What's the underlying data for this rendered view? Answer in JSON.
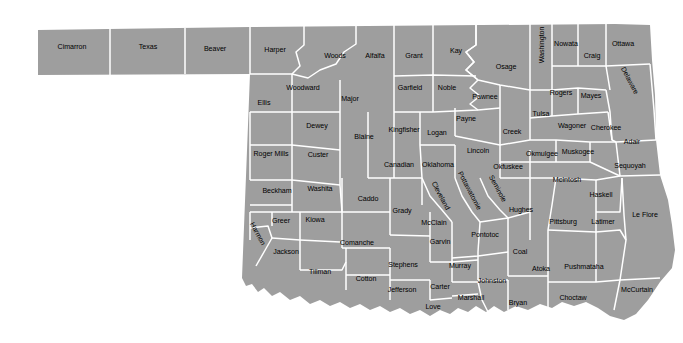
{
  "map": {
    "title": "Oklahoma County Map",
    "state": "Oklahoma",
    "colors": {
      "land_fill": "#9e9e9e",
      "border": "#ffffff",
      "background": "#ffffff",
      "label_text": "#000000"
    },
    "county_count": 77,
    "counties": [
      {
        "name": "Cimarron",
        "x": 72,
        "y": 48,
        "rot": 0
      },
      {
        "name": "Texas",
        "x": 148,
        "y": 48,
        "rot": 0
      },
      {
        "name": "Beaver",
        "x": 215,
        "y": 50,
        "rot": 0
      },
      {
        "name": "Harper",
        "x": 275,
        "y": 51,
        "rot": 0
      },
      {
        "name": "Woods",
        "x": 335,
        "y": 57,
        "rot": 0
      },
      {
        "name": "Alfalfa",
        "x": 375,
        "y": 57,
        "rot": 0
      },
      {
        "name": "Grant",
        "x": 414,
        "y": 57,
        "rot": 0
      },
      {
        "name": "Kay",
        "x": 456,
        "y": 52,
        "rot": 0
      },
      {
        "name": "Osage",
        "x": 506,
        "y": 68,
        "rot": 0
      },
      {
        "name": "Washington",
        "x": 543,
        "y": 45,
        "rot": -90
      },
      {
        "name": "Nowata",
        "x": 566,
        "y": 45,
        "rot": 0
      },
      {
        "name": "Craig",
        "x": 592,
        "y": 57,
        "rot": 0
      },
      {
        "name": "Ottawa",
        "x": 623,
        "y": 45,
        "rot": 0
      },
      {
        "name": "Woodward",
        "x": 303,
        "y": 89,
        "rot": 0
      },
      {
        "name": "Ellis",
        "x": 264,
        "y": 104,
        "rot": 0
      },
      {
        "name": "Major",
        "x": 350,
        "y": 100,
        "rot": 0
      },
      {
        "name": "Garfield",
        "x": 410,
        "y": 89,
        "rot": 0
      },
      {
        "name": "Noble",
        "x": 447,
        "y": 89,
        "rot": 0
      },
      {
        "name": "Pawnee",
        "x": 485,
        "y": 98,
        "rot": 0
      },
      {
        "name": "Tulsa",
        "x": 541,
        "y": 115,
        "rot": 0
      },
      {
        "name": "Rogers",
        "x": 561,
        "y": 94,
        "rot": 0
      },
      {
        "name": "Mayes",
        "x": 591,
        "y": 97,
        "rot": 0
      },
      {
        "name": "Delaware",
        "x": 629,
        "y": 81,
        "rot": 62
      },
      {
        "name": "Dewey",
        "x": 317,
        "y": 127,
        "rot": 0
      },
      {
        "name": "Blaine",
        "x": 364,
        "y": 138,
        "rot": 0
      },
      {
        "name": "Kingfisher",
        "x": 404,
        "y": 131,
        "rot": 0
      },
      {
        "name": "Logan",
        "x": 437,
        "y": 134,
        "rot": 0
      },
      {
        "name": "Payne",
        "x": 466,
        "y": 120,
        "rot": 0
      },
      {
        "name": "Creek",
        "x": 512,
        "y": 133,
        "rot": 0
      },
      {
        "name": "Wagoner",
        "x": 572,
        "y": 127,
        "rot": 0
      },
      {
        "name": "Cherokee",
        "x": 606,
        "y": 129,
        "rot": 0
      },
      {
        "name": "Adair",
        "x": 632,
        "y": 143,
        "rot": 0
      },
      {
        "name": "Roger Mills",
        "x": 271,
        "y": 155,
        "rot": 0
      },
      {
        "name": "Custer",
        "x": 318,
        "y": 156,
        "rot": 0
      },
      {
        "name": "Canadian",
        "x": 399,
        "y": 166,
        "rot": 0
      },
      {
        "name": "Oklahoma",
        "x": 438,
        "y": 166,
        "rot": 0
      },
      {
        "name": "Lincoln",
        "x": 478,
        "y": 152,
        "rot": 0
      },
      {
        "name": "Okfuskee",
        "x": 508,
        "y": 168,
        "rot": 0
      },
      {
        "name": "Okmulgee",
        "x": 542,
        "y": 155,
        "rot": 0
      },
      {
        "name": "Muskogee",
        "x": 578,
        "y": 153,
        "rot": 0
      },
      {
        "name": "Sequoyah",
        "x": 630,
        "y": 167,
        "rot": 0
      },
      {
        "name": "Beckham",
        "x": 277,
        "y": 192,
        "rot": 0
      },
      {
        "name": "Washita",
        "x": 320,
        "y": 190,
        "rot": 0
      },
      {
        "name": "Caddo",
        "x": 368,
        "y": 200,
        "rot": 0
      },
      {
        "name": "Cleveland",
        "x": 440,
        "y": 196,
        "rot": 62
      },
      {
        "name": "Pottawatomie",
        "x": 469,
        "y": 191,
        "rot": 62
      },
      {
        "name": "Seminole",
        "x": 497,
        "y": 189,
        "rot": 62
      },
      {
        "name": "McIntosh",
        "x": 567,
        "y": 181,
        "rot": 0
      },
      {
        "name": "Haskell",
        "x": 601,
        "y": 196,
        "rot": 0
      },
      {
        "name": "Greer",
        "x": 281,
        "y": 222,
        "rot": 0
      },
      {
        "name": "Kiowa",
        "x": 315,
        "y": 221,
        "rot": 0
      },
      {
        "name": "Harmon",
        "x": 257,
        "y": 234,
        "rot": 62
      },
      {
        "name": "Grady",
        "x": 402,
        "y": 212,
        "rot": 0
      },
      {
        "name": "McClain",
        "x": 434,
        "y": 224,
        "rot": 0
      },
      {
        "name": "Hughes",
        "x": 521,
        "y": 211,
        "rot": 0
      },
      {
        "name": "Pittsburg",
        "x": 563,
        "y": 223,
        "rot": 0
      },
      {
        "name": "Latimer",
        "x": 603,
        "y": 223,
        "rot": 0
      },
      {
        "name": "Le Flore",
        "x": 645,
        "y": 216,
        "rot": 0
      },
      {
        "name": "Jackson",
        "x": 286,
        "y": 253,
        "rot": 0
      },
      {
        "name": "Comanche",
        "x": 357,
        "y": 244,
        "rot": 0
      },
      {
        "name": "Garvin",
        "x": 440,
        "y": 243,
        "rot": 0
      },
      {
        "name": "Pontotoc",
        "x": 485,
        "y": 236,
        "rot": 0
      },
      {
        "name": "Coal",
        "x": 520,
        "y": 253,
        "rot": 0
      },
      {
        "name": "Atoka",
        "x": 541,
        "y": 270,
        "rot": 0
      },
      {
        "name": "Pushmataha",
        "x": 584,
        "y": 268,
        "rot": 0
      },
      {
        "name": "McCurtain",
        "x": 637,
        "y": 291,
        "rot": 0
      },
      {
        "name": "Tillman",
        "x": 320,
        "y": 273,
        "rot": 0
      },
      {
        "name": "Cotton",
        "x": 366,
        "y": 280,
        "rot": 0
      },
      {
        "name": "Stephens",
        "x": 403,
        "y": 266,
        "rot": 0
      },
      {
        "name": "Murray",
        "x": 460,
        "y": 267,
        "rot": 0
      },
      {
        "name": "Johnston",
        "x": 492,
        "y": 282,
        "rot": 0
      },
      {
        "name": "Jefferson",
        "x": 402,
        "y": 291,
        "rot": 0
      },
      {
        "name": "Carter",
        "x": 440,
        "y": 288,
        "rot": 0
      },
      {
        "name": "Love",
        "x": 433,
        "y": 308,
        "rot": 0
      },
      {
        "name": "Marshall",
        "x": 471,
        "y": 299,
        "rot": 0
      },
      {
        "name": "Bryan",
        "x": 518,
        "y": 304,
        "rot": 0
      },
      {
        "name": "Choctaw",
        "x": 573,
        "y": 299,
        "rot": 0
      }
    ]
  }
}
